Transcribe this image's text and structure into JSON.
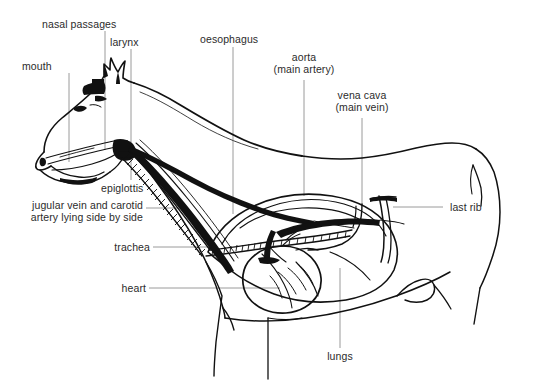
{
  "figure": {
    "background_color": "#ffffff",
    "ink_color": "#111111",
    "leader_color": "#9a9a9a",
    "text_color": "#2b2b2b"
  },
  "labels": {
    "mouth": "mouth",
    "nasal_passages": "nasal passages",
    "larynx": "larynx",
    "oesophagus": "oesophagus",
    "aorta_line1": "aorta",
    "aorta_line2": "(main artery)",
    "vena_cava_line1": "vena cava",
    "vena_cava_line2": "(main vein)",
    "epiglottis": "epiglottis",
    "jugular_line1": "jugular vein and carotid",
    "jugular_line2": "artery lying side by side",
    "trachea": "trachea",
    "heart": "heart",
    "last_rib": "last rib",
    "lungs": "lungs"
  }
}
